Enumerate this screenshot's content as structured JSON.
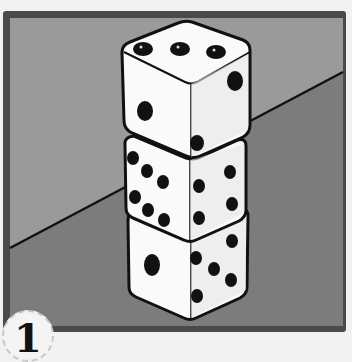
{
  "illustration": {
    "subject": "stack of three dice",
    "colors": {
      "paper": "#f2f2f2",
      "frame": "#4a4a4a",
      "wall": "#9a9a9a",
      "floor": "#7c7c7c",
      "line": "#111111",
      "die_face": "#ffffff",
      "pip": "#111111"
    },
    "dice": [
      {
        "position": "top",
        "top_face": 3,
        "left_face": 2,
        "right_face": 2
      },
      {
        "position": "middle",
        "left_face": 6,
        "right_face": 4
      },
      {
        "position": "bottom",
        "left_face": 1,
        "right_face": 5
      }
    ]
  },
  "badge": {
    "number": "1"
  }
}
